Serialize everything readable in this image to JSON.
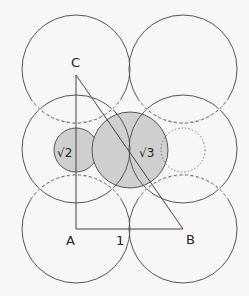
{
  "diagram": {
    "colors": {
      "stroke": "#555555",
      "shade": "#cfcfcf",
      "background": "#f7f7f7",
      "text": "#222222"
    },
    "points": {
      "C": {
        "label": "C",
        "x": 76,
        "y": 75
      },
      "A": {
        "label": "A",
        "x": 76,
        "y": 229
      },
      "B": {
        "label": "B",
        "x": 183,
        "y": 229
      }
    },
    "labels": {
      "C": "C",
      "A": "A",
      "B": "B",
      "side_AB": "1",
      "small_circle": "√2",
      "big_circle": "√3"
    },
    "grid_circles": [
      {
        "cx": 76,
        "cy": 69,
        "r": 54
      },
      {
        "cx": 183,
        "cy": 69,
        "r": 54
      },
      {
        "cx": 76,
        "cy": 149,
        "r": 54
      },
      {
        "cx": 183,
        "cy": 149,
        "r": 54
      },
      {
        "cx": 76,
        "cy": 229,
        "r": 54
      },
      {
        "cx": 183,
        "cy": 229,
        "r": 54
      }
    ],
    "shaded_circles": [
      {
        "name": "sqrt2-circle",
        "cx": 76,
        "cy": 150,
        "r": 22
      },
      {
        "name": "sqrt3-circle",
        "cx": 130,
        "cy": 150,
        "r": 38
      }
    ],
    "dotted_circle": {
      "cx": 183,
      "cy": 150,
      "r": 22
    }
  }
}
